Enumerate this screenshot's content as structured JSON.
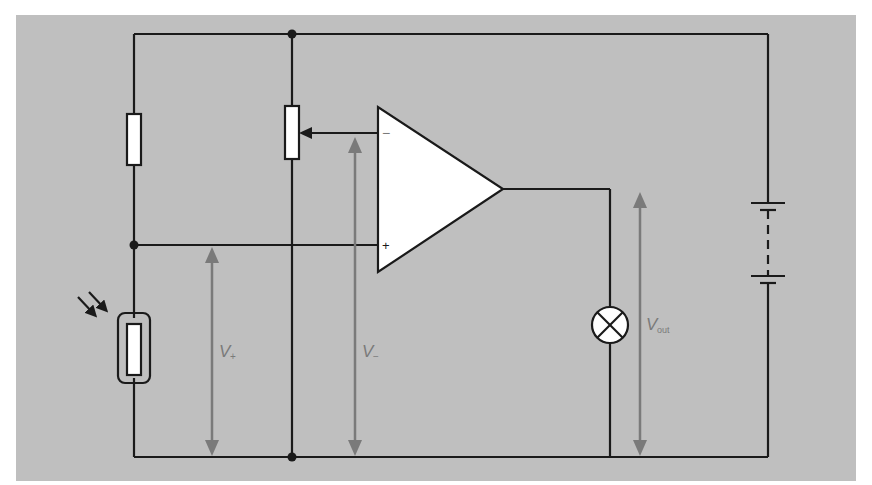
{
  "diagram": {
    "type": "circuit-schematic",
    "colors": {
      "background_panel": "#bfbfbf",
      "wire": "#1a1a1a",
      "component_fill": "#ffffff",
      "voltage_arrow": "#7a7a7a",
      "label": "#7a7a7a"
    },
    "components": [
      {
        "id": "R1",
        "kind": "fixed-resistor",
        "position": "top-left branch"
      },
      {
        "id": "LDR",
        "kind": "light-dependent-resistor",
        "position": "bottom-left branch"
      },
      {
        "id": "VR1",
        "kind": "potentiometer",
        "position": "middle branch, wiper to inverting input"
      },
      {
        "id": "U1",
        "kind": "op-amp",
        "inputs": [
          "-",
          "+"
        ]
      },
      {
        "id": "L1",
        "kind": "lamp",
        "position": "output to ground"
      },
      {
        "id": "B1",
        "kind": "battery",
        "position": "right supply"
      }
    ],
    "opamp": {
      "minus_label": "−",
      "plus_label": "+"
    },
    "labels": {
      "v_plus": {
        "main": "V",
        "sub": "+"
      },
      "v_minus": {
        "main": "V",
        "sub": "−"
      },
      "v_out": {
        "main": "V",
        "sub": "out"
      }
    }
  }
}
